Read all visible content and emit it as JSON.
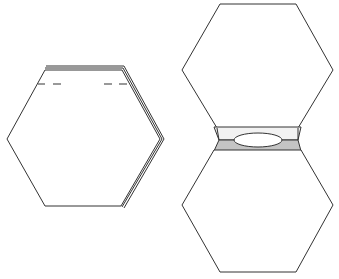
{
  "diagram": {
    "title": "",
    "colors": {
      "stroke": "#333333",
      "fill": "#ffffff",
      "seam_light": "#f2f2f2",
      "seam_gray": "#c4c4c4",
      "dash": "#555555"
    },
    "figures": [
      {
        "id": "folded-hexagon",
        "label": "",
        "note": "Hexagon with folded fabric layers and dashed stitch marks"
      },
      {
        "id": "joined-hexagons",
        "label": "",
        "note": "Two hexagons joined by a seam strip with an opening"
      }
    ]
  }
}
